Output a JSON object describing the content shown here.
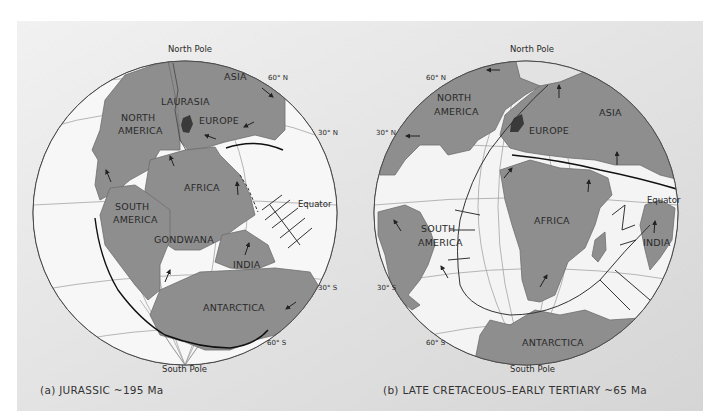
{
  "figure": {
    "background_gradient": [
      "#f0f0f0",
      "#d6d6d6"
    ],
    "land_color": "#8e8e8e",
    "ocean_color": "#ffffff",
    "shelf_color": "#e9e9e9",
    "grid_color": "#9a9a9a"
  },
  "panel_a": {
    "caption": "(a)   JURASSIC ~195 Ma",
    "north_pole": "North Pole",
    "south_pole": "South Pole",
    "lat_60n": "60° N",
    "lat_30n": "30° N",
    "equator": "Equator",
    "lat_30s": "30° S",
    "lat_60s": "60° S",
    "landmasses": {
      "asia": "ASIA",
      "laurasia": "LAURASIA",
      "europe": "EUROPE",
      "north_america_1": "NORTH",
      "north_america_2": "AMERICA",
      "africa": "AFRICA",
      "south_america_1": "SOUTH",
      "south_america_2": "AMERICA",
      "gondwana": "GONDWANA",
      "india": "INDIA",
      "antarctica": "ANTARCTICA"
    }
  },
  "panel_b": {
    "caption": "(b)   LATE CRETACEOUS–EARLY TERTIARY ~65 Ma",
    "north_pole": "North Pole",
    "south_pole": "South Pole",
    "lat_60n": "60° N",
    "lat_30n": "30° N",
    "equator": "Equator",
    "lat_30s": "30° S",
    "lat_60s": "60° S",
    "landmasses": {
      "north_america_1": "NORTH",
      "north_america_2": "AMERICA",
      "europe": "EUROPE",
      "asia": "ASIA",
      "africa": "AFRICA",
      "south_america_1": "SOUTH",
      "south_america_2": "AMERICA",
      "india": "INDIA",
      "antarctica": "ANTARCTICA"
    }
  }
}
